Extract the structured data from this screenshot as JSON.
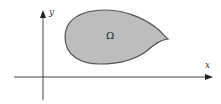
{
  "diagram": {
    "type": "region-in-plane",
    "axes": {
      "x_label": "x",
      "y_label": "y",
      "axis_color": "#333333"
    },
    "region": {
      "label": "Ω",
      "fill_color": "#bdbdbd",
      "stroke_color": "#555555",
      "shape": "teardrop"
    }
  }
}
